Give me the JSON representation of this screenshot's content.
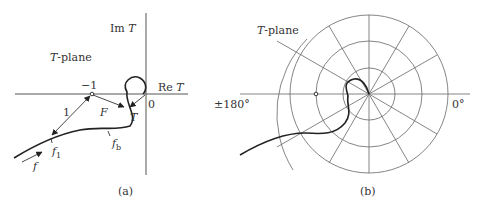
{
  "panel_a": {
    "caption": "(a)",
    "plane_label": "T-plane",
    "plane_label_italic": "T",
    "plane_label_rest": "-plane",
    "im_axis": "Im T",
    "im_axis_prefix": "Im ",
    "im_axis_var": "T",
    "re_axis": "Re T",
    "re_axis_prefix": "Re ",
    "re_axis_var": "T",
    "origin": "0",
    "critical_point": "−1",
    "distance_label": "1",
    "vector_F": "F",
    "vector_T": "T",
    "freq_f": "f",
    "freq_f1": "f",
    "freq_f1_sub": "1",
    "freq_fb": "f",
    "freq_fb_sub": "b"
  },
  "panel_b": {
    "caption": "(b)",
    "plane_label_italic": "T",
    "plane_label_rest": "-plane",
    "angle_left": "±180°",
    "angle_right": "0°"
  }
}
